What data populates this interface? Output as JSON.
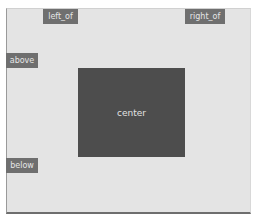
{
  "diagram": {
    "labels": {
      "left_of": "left_of",
      "right_of": "right_of",
      "above": "above",
      "below": "below",
      "center": "center"
    },
    "colors": {
      "background": "#e4e4e4",
      "label_fill": "#6f6f6f",
      "center_fill": "#4d4d4d",
      "text": "#e6e6e6"
    }
  }
}
